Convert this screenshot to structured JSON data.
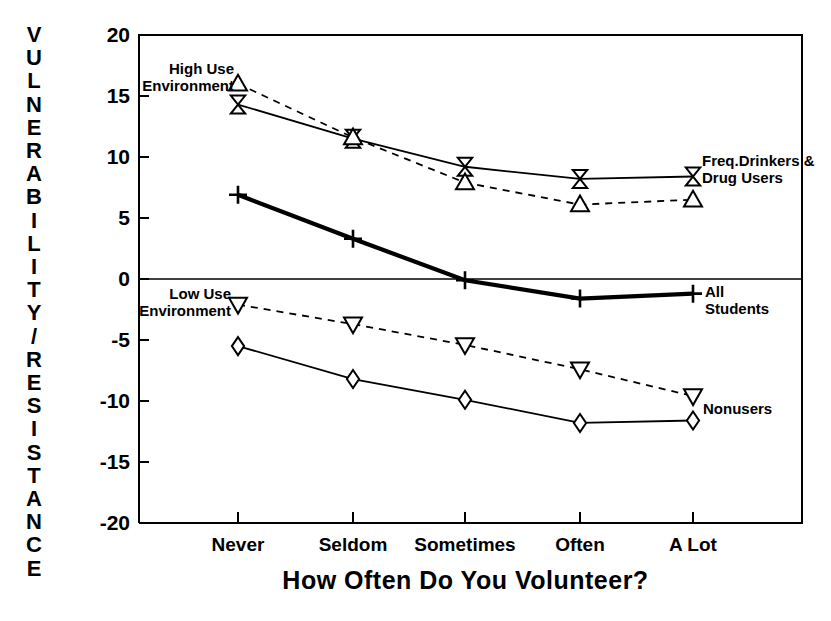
{
  "chart_data": {
    "type": "line",
    "title": "",
    "xlabel": "How Often Do You Volunteer?",
    "ylabel": "VULNERABILITY/RESISTANCE",
    "categories": [
      "Never",
      "Seldom",
      "Sometimes",
      "Often",
      "A Lot"
    ],
    "ylim": [
      -20,
      20
    ],
    "yticks": [
      20,
      15,
      10,
      5,
      0,
      -5,
      -10,
      -15,
      -20
    ],
    "ytick_labels": [
      "20",
      "15",
      "10",
      "5",
      "0",
      "-5",
      "-10",
      "-15",
      "-20"
    ],
    "grid": false,
    "legend_position": "inline-annotations",
    "zero_line": true,
    "series": [
      {
        "name": "Freq.Drinkers & Drug Users",
        "marker": "bowtie",
        "linestyle": "solid",
        "linewidth": "thin",
        "values": [
          14.3,
          11.5,
          9.2,
          8.2,
          8.4
        ]
      },
      {
        "name": "High Use Environment",
        "marker": "triangle-up",
        "linestyle": "dashed",
        "linewidth": "thin",
        "values": [
          16.0,
          11.6,
          7.9,
          6.1,
          6.5
        ]
      },
      {
        "name": "All Students",
        "marker": "plus",
        "linestyle": "solid",
        "linewidth": "thick",
        "values": [
          6.9,
          3.3,
          -0.1,
          -1.6,
          -1.2
        ]
      },
      {
        "name": "Low Use Environment",
        "marker": "triangle-down",
        "linestyle": "dashed",
        "linewidth": "thin",
        "values": [
          -2.1,
          -3.7,
          -5.4,
          -7.4,
          -9.6
        ]
      },
      {
        "name": "Nonusers",
        "marker": "diamond",
        "linestyle": "solid",
        "linewidth": "thin",
        "values": [
          -5.5,
          -8.2,
          -9.9,
          -11.8,
          -11.6
        ]
      }
    ],
    "annotations": [
      {
        "text_lines": [
          "High Use",
          "Environment"
        ],
        "anchor": "end",
        "x": 234,
        "y": 74
      },
      {
        "text_lines": [
          "Low Use",
          "Environment"
        ],
        "anchor": "end",
        "x": 231,
        "y": 299
      },
      {
        "text_lines": [
          "Freq.Drinkers &",
          "Drug Users"
        ],
        "anchor": "start",
        "x": 702,
        "y": 166
      },
      {
        "text_lines": [
          "All",
          "Students"
        ],
        "anchor": "start",
        "x": 705,
        "y": 297
      },
      {
        "text_lines": [
          "Nonusers"
        ],
        "anchor": "start",
        "x": 703,
        "y": 414
      }
    ]
  }
}
